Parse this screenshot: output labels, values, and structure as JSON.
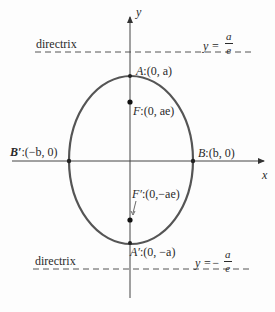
{
  "diagram": {
    "type": "ellipse-with-directrices",
    "axes": {
      "x_label": "x",
      "y_label": "y"
    },
    "directrices": {
      "upper": {
        "label": "directrix",
        "equation_prefix": "y =",
        "numerator": "a",
        "denominator": "e"
      },
      "lower": {
        "label": "directrix",
        "equation_prefix": "y =−",
        "numerator": "a",
        "denominator": "e"
      }
    },
    "points": {
      "A": {
        "name": "A",
        "coords": ":(0,  a)"
      },
      "F": {
        "name": "F",
        "coords": ":(0,  ae)"
      },
      "Bp": {
        "name": "B′",
        "coords": ":(−b, 0)"
      },
      "B": {
        "name": "B",
        "coords": ":(b,  0)"
      },
      "Fp": {
        "name": "F′",
        "coords": ":(0,−ae)"
      },
      "Ap": {
        "name": "A′",
        "coords": ":(0, −a)"
      }
    },
    "colors": {
      "curve": "#555555",
      "axis": "#444444",
      "text": "#2a2a2a"
    }
  }
}
